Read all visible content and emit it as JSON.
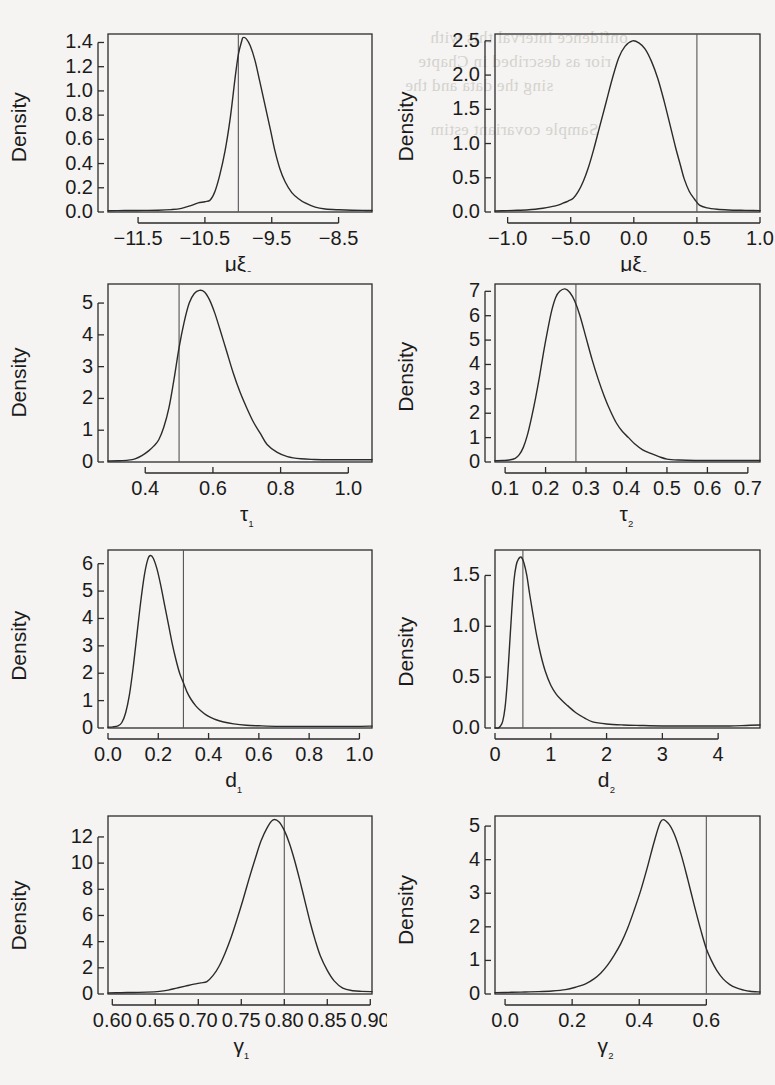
{
  "figure": {
    "type": "multi-panel-density",
    "rows": 4,
    "cols": 2,
    "y_axis_label": "Density",
    "line_color": "#2b2b2b",
    "vline_color": "#555555",
    "background": "#f5f4f2",
    "page_width": 775,
    "page_height": 1085
  },
  "bleed_through_text": [
    "onfidence interval this with",
    "rior as described in Chapte",
    "ssing the data and the",
    "Sample covariant estim"
  ],
  "chart_data": [
    {
      "type": "line",
      "title": "",
      "xlabel": "μξ₂",
      "ylabel": "Density",
      "xlim": [
        -11.95,
        -8.0
      ],
      "ylim": [
        0.0,
        1.47
      ],
      "xticks": [
        -11.5,
        -10.5,
        -9.5,
        -8.5
      ],
      "xticklabels": [
        "−11.5",
        "−10.5",
        "−9.5",
        "−8.5"
      ],
      "yticks": [
        0.0,
        0.2,
        0.4,
        0.6,
        0.8,
        1.0,
        1.2,
        1.4
      ],
      "yticklabels": [
        "0.0",
        "0.2",
        "0.4",
        "0.6",
        "0.8",
        "1.0",
        "1.2",
        "1.4"
      ],
      "vline": -10.0,
      "peak_x": -9.93,
      "peak_y": 1.44,
      "x": [
        -11.95,
        -11.7,
        -11.5,
        -11.2,
        -11.0,
        -10.85,
        -10.7,
        -10.6,
        -10.5,
        -10.42,
        -10.35,
        -10.28,
        -10.2,
        -10.12,
        -10.05,
        -10.0,
        -9.95,
        -9.93,
        -9.88,
        -9.82,
        -9.75,
        -9.68,
        -9.6,
        -9.52,
        -9.45,
        -9.38,
        -9.3,
        -9.2,
        -9.1,
        -9.0,
        -8.85,
        -8.7,
        -8.5,
        -8.3,
        -8.1,
        -8.0
      ],
      "y": [
        0.01,
        0.012,
        0.013,
        0.015,
        0.02,
        0.03,
        0.055,
        0.075,
        0.085,
        0.1,
        0.17,
        0.3,
        0.5,
        0.78,
        1.1,
        1.3,
        1.41,
        1.44,
        1.43,
        1.37,
        1.25,
        1.08,
        0.88,
        0.68,
        0.5,
        0.36,
        0.25,
        0.16,
        0.11,
        0.075,
        0.04,
        0.025,
        0.018,
        0.014,
        0.013,
        0.013
      ]
    },
    {
      "type": "line",
      "title": "",
      "xlabel": "μξ₂",
      "ylabel": "Density",
      "xlim": [
        -1.1,
        1.0
      ],
      "ylim": [
        0.0,
        2.6
      ],
      "xticks": [
        -1.0,
        -0.5,
        0.0,
        0.5,
        1.0
      ],
      "xticklabels": [
        "−1.0",
        "−5.0",
        "0.0",
        "0.5",
        "1.0"
      ],
      "yticks": [
        0.0,
        0.5,
        1.0,
        1.5,
        2.0,
        2.5
      ],
      "yticklabels": [
        "0.0",
        "0.5",
        "1.0",
        "1.5",
        "2.0",
        "2.5"
      ],
      "vline": 0.5,
      "peak_x": -0.01,
      "peak_y": 2.5,
      "x": [
        -1.1,
        -1.0,
        -0.92,
        -0.85,
        -0.78,
        -0.72,
        -0.66,
        -0.6,
        -0.56,
        -0.52,
        -0.48,
        -0.44,
        -0.4,
        -0.36,
        -0.32,
        -0.27,
        -0.22,
        -0.17,
        -0.12,
        -0.07,
        -0.01,
        0.04,
        0.09,
        0.14,
        0.19,
        0.24,
        0.29,
        0.33,
        0.37,
        0.4,
        0.44,
        0.48,
        0.52,
        0.58,
        0.66,
        0.75,
        0.85,
        0.95,
        1.0
      ],
      "y": [
        0.015,
        0.02,
        0.025,
        0.03,
        0.04,
        0.055,
        0.075,
        0.1,
        0.13,
        0.16,
        0.2,
        0.3,
        0.45,
        0.65,
        0.9,
        1.25,
        1.6,
        1.95,
        2.25,
        2.42,
        2.5,
        2.47,
        2.38,
        2.2,
        1.95,
        1.62,
        1.25,
        0.95,
        0.68,
        0.48,
        0.3,
        0.19,
        0.1,
        0.06,
        0.04,
        0.03,
        0.025,
        0.022,
        0.02
      ]
    },
    {
      "type": "line",
      "title": "",
      "xlabel": "τ₁",
      "ylabel": "Density",
      "xlim": [
        0.29,
        1.07
      ],
      "ylim": [
        0.0,
        5.6
      ],
      "xticks": [
        0.4,
        0.6,
        0.8,
        1.0
      ],
      "xticklabels": [
        "0.4",
        "0.6",
        "0.8",
        "1.0"
      ],
      "yticks": [
        0,
        1,
        2,
        3,
        4,
        5
      ],
      "yticklabels": [
        "0",
        "1",
        "2",
        "3",
        "4",
        "5"
      ],
      "vline": 0.5,
      "peak_x": 0.55,
      "peak_y": 5.4,
      "x": [
        0.29,
        0.32,
        0.35,
        0.37,
        0.39,
        0.41,
        0.425,
        0.44,
        0.455,
        0.47,
        0.485,
        0.5,
        0.515,
        0.53,
        0.545,
        0.56,
        0.575,
        0.59,
        0.605,
        0.62,
        0.64,
        0.66,
        0.68,
        0.7,
        0.72,
        0.74,
        0.76,
        0.79,
        0.82,
        0.86,
        0.9,
        0.95,
        1.0,
        1.04,
        1.07
      ],
      "y": [
        0.03,
        0.04,
        0.06,
        0.1,
        0.2,
        0.35,
        0.5,
        0.7,
        1.1,
        1.7,
        2.6,
        3.6,
        4.4,
        5.0,
        5.3,
        5.4,
        5.35,
        5.1,
        4.7,
        4.2,
        3.5,
        2.8,
        2.2,
        1.7,
        1.25,
        0.9,
        0.55,
        0.3,
        0.17,
        0.1,
        0.08,
        0.07,
        0.07,
        0.07,
        0.07
      ]
    },
    {
      "type": "line",
      "title": "",
      "xlabel": "τ₂",
      "ylabel": "Density",
      "xlim": [
        0.075,
        0.73
      ],
      "ylim": [
        0.0,
        7.3
      ],
      "xticks": [
        0.1,
        0.2,
        0.3,
        0.4,
        0.5,
        0.6,
        0.7
      ],
      "xticklabels": [
        "0.1",
        "0.2",
        "0.3",
        "0.4",
        "0.5",
        "0.6",
        "0.7"
      ],
      "yticks": [
        0,
        1,
        2,
        3,
        4,
        5,
        6,
        7
      ],
      "yticklabels": [
        "0",
        "1",
        "2",
        "3",
        "4",
        "5",
        "6",
        "7"
      ],
      "vline": 0.275,
      "peak_x": 0.248,
      "peak_y": 7.1,
      "x": [
        0.075,
        0.095,
        0.11,
        0.125,
        0.135,
        0.145,
        0.155,
        0.165,
        0.175,
        0.185,
        0.195,
        0.205,
        0.215,
        0.225,
        0.235,
        0.248,
        0.26,
        0.272,
        0.285,
        0.3,
        0.315,
        0.33,
        0.345,
        0.36,
        0.375,
        0.39,
        0.405,
        0.42,
        0.44,
        0.46,
        0.48,
        0.5,
        0.53,
        0.57,
        0.62,
        0.67,
        0.73
      ],
      "y": [
        0.05,
        0.06,
        0.08,
        0.15,
        0.3,
        0.6,
        1.1,
        1.8,
        2.6,
        3.5,
        4.5,
        5.4,
        6.2,
        6.75,
        7.0,
        7.1,
        6.95,
        6.6,
        6.0,
        5.1,
        4.2,
        3.4,
        2.7,
        2.1,
        1.6,
        1.25,
        1.0,
        0.75,
        0.5,
        0.35,
        0.22,
        0.12,
        0.08,
        0.06,
        0.06,
        0.06,
        0.06
      ]
    },
    {
      "type": "line",
      "title": "",
      "xlabel": "d₁",
      "ylabel": "Density",
      "xlim": [
        0.0,
        1.05
      ],
      "ylim": [
        0.0,
        6.5
      ],
      "xticks": [
        0.0,
        0.2,
        0.4,
        0.6,
        0.8,
        1.0
      ],
      "xticklabels": [
        "0.0",
        "0.2",
        "0.4",
        "0.6",
        "0.8",
        "1.0"
      ],
      "yticks": [
        0,
        1,
        2,
        3,
        4,
        5,
        6
      ],
      "yticklabels": [
        "0",
        "1",
        "2",
        "3",
        "4",
        "5",
        "6"
      ],
      "vline": 0.3,
      "peak_x": 0.165,
      "peak_y": 6.3,
      "x": [
        0.0,
        0.02,
        0.04,
        0.055,
        0.07,
        0.085,
        0.1,
        0.115,
        0.13,
        0.145,
        0.158,
        0.168,
        0.18,
        0.195,
        0.21,
        0.225,
        0.24,
        0.255,
        0.27,
        0.285,
        0.3,
        0.315,
        0.33,
        0.35,
        0.37,
        0.39,
        0.41,
        0.43,
        0.46,
        0.5,
        0.55,
        0.6,
        0.68,
        0.78,
        0.88,
        0.98,
        1.05
      ],
      "y": [
        0.03,
        0.04,
        0.08,
        0.2,
        0.55,
        1.2,
        2.2,
        3.4,
        4.6,
        5.6,
        6.15,
        6.3,
        6.2,
        5.8,
        5.2,
        4.5,
        3.8,
        3.1,
        2.5,
        2.0,
        1.65,
        1.3,
        1.05,
        0.8,
        0.62,
        0.48,
        0.38,
        0.3,
        0.22,
        0.15,
        0.1,
        0.08,
        0.06,
        0.06,
        0.06,
        0.06,
        0.07
      ]
    },
    {
      "type": "line",
      "title": "",
      "xlabel": "d₂",
      "ylabel": "Density",
      "xlim": [
        0.0,
        4.75
      ],
      "ylim": [
        0.0,
        1.75
      ],
      "xticks": [
        0,
        1,
        2,
        3,
        4
      ],
      "xticklabels": [
        "0",
        "1",
        "2",
        "3",
        "4"
      ],
      "yticks": [
        0.0,
        0.5,
        1.0,
        1.5
      ],
      "yticklabels": [
        "0.0",
        "0.5",
        "1.0",
        "1.5"
      ],
      "vline": 0.5,
      "peak_x": 0.47,
      "peak_y": 1.68,
      "x": [
        0.0,
        0.06,
        0.1,
        0.14,
        0.18,
        0.22,
        0.26,
        0.3,
        0.34,
        0.38,
        0.42,
        0.47,
        0.52,
        0.57,
        0.62,
        0.68,
        0.75,
        0.82,
        0.9,
        1.0,
        1.1,
        1.2,
        1.3,
        1.45,
        1.6,
        1.75,
        2.0,
        2.3,
        2.6,
        3.0,
        3.4,
        3.8,
        4.2,
        4.5,
        4.75
      ],
      "y": [
        0.0,
        0.0,
        0.02,
        0.07,
        0.2,
        0.45,
        0.8,
        1.15,
        1.45,
        1.6,
        1.66,
        1.68,
        1.62,
        1.5,
        1.32,
        1.12,
        0.9,
        0.72,
        0.56,
        0.42,
        0.33,
        0.27,
        0.22,
        0.15,
        0.1,
        0.06,
        0.04,
        0.03,
        0.025,
        0.02,
        0.02,
        0.02,
        0.02,
        0.025,
        0.03
      ]
    },
    {
      "type": "line",
      "title": "",
      "xlabel": "γ₁",
      "ylabel": "Density",
      "xlim": [
        0.595,
        0.902
      ],
      "ylim": [
        0.0,
        13.6
      ],
      "xticks": [
        0.6,
        0.65,
        0.7,
        0.75,
        0.8,
        0.85,
        0.9
      ],
      "xticklabels": [
        "0.60",
        "0.65",
        "0.70",
        "0.75",
        "0.80",
        "0.85",
        "0.90"
      ],
      "yticks": [
        0,
        2,
        4,
        6,
        8,
        10,
        12
      ],
      "yticklabels": [
        "0",
        "2",
        "4",
        "6",
        "8",
        "10",
        "12"
      ],
      "vline": 0.8,
      "peak_x": 0.787,
      "peak_y": 13.3,
      "x": [
        0.595,
        0.61,
        0.625,
        0.64,
        0.655,
        0.665,
        0.675,
        0.685,
        0.695,
        0.703,
        0.71,
        0.717,
        0.724,
        0.731,
        0.738,
        0.745,
        0.752,
        0.759,
        0.766,
        0.773,
        0.78,
        0.787,
        0.794,
        0.8,
        0.806,
        0.812,
        0.818,
        0.824,
        0.83,
        0.836,
        0.842,
        0.85,
        0.858,
        0.868,
        0.88,
        0.89,
        0.902
      ],
      "y": [
        0.08,
        0.1,
        0.12,
        0.14,
        0.2,
        0.3,
        0.45,
        0.6,
        0.75,
        0.85,
        0.95,
        1.4,
        2.1,
        3.1,
        4.3,
        5.7,
        7.2,
        8.8,
        10.3,
        11.7,
        12.7,
        13.3,
        13.15,
        12.5,
        11.5,
        10.2,
        8.7,
        7.1,
        5.5,
        4.1,
        2.9,
        1.8,
        1.0,
        0.45,
        0.25,
        0.2,
        0.18
      ]
    },
    {
      "type": "line",
      "title": "",
      "xlabel": "γ₂",
      "ylabel": "Density",
      "xlim": [
        -0.03,
        0.76
      ],
      "ylim": [
        0.0,
        5.3
      ],
      "xticks": [
        0.0,
        0.2,
        0.4,
        0.6
      ],
      "xticklabels": [
        "0.0",
        "0.2",
        "0.4",
        "0.6"
      ],
      "yticks": [
        0,
        1,
        2,
        3,
        4,
        5
      ],
      "yticklabels": [
        "0",
        "1",
        "2",
        "3",
        "4",
        "5"
      ],
      "vline": 0.6,
      "peak_x": 0.465,
      "peak_y": 5.15,
      "x": [
        -0.03,
        0.02,
        0.06,
        0.1,
        0.14,
        0.18,
        0.21,
        0.24,
        0.265,
        0.285,
        0.305,
        0.325,
        0.345,
        0.365,
        0.385,
        0.405,
        0.425,
        0.445,
        0.465,
        0.485,
        0.505,
        0.525,
        0.545,
        0.565,
        0.585,
        0.6,
        0.615,
        0.63,
        0.65,
        0.67,
        0.69,
        0.71,
        0.73,
        0.76
      ],
      "y": [
        0.04,
        0.05,
        0.06,
        0.07,
        0.09,
        0.13,
        0.2,
        0.3,
        0.45,
        0.62,
        0.85,
        1.15,
        1.5,
        1.95,
        2.5,
        3.1,
        3.8,
        4.55,
        5.15,
        5.1,
        4.75,
        4.15,
        3.4,
        2.6,
        1.85,
        1.35,
        1.0,
        0.72,
        0.45,
        0.28,
        0.18,
        0.12,
        0.08,
        0.06
      ]
    }
  ]
}
